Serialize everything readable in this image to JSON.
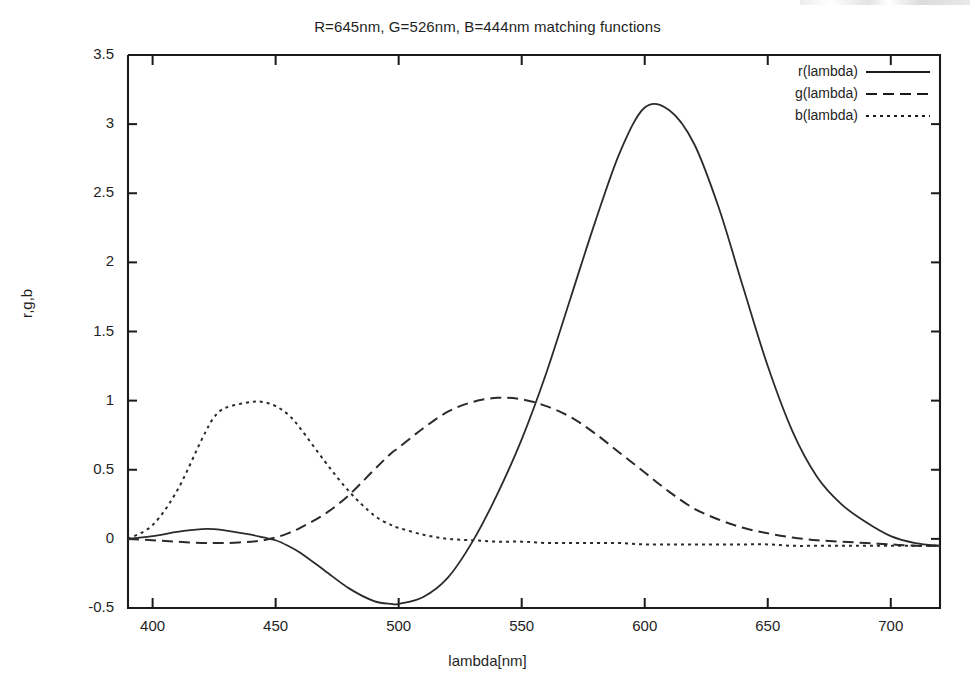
{
  "chart_data": {
    "type": "line",
    "title": "R=645nm, G=526nm, B=444nm matching functions",
    "xlabel": "lambda[nm]",
    "ylabel": "r,g,b",
    "xlim": [
      390,
      720
    ],
    "ylim": [
      -0.5,
      3.5
    ],
    "grid": false,
    "legend_position": "top-right inside",
    "xticks": [
      400,
      450,
      500,
      550,
      600,
      650,
      700
    ],
    "xtick_labels": [
      "400",
      "450",
      "500",
      "550",
      "600",
      "650",
      "700"
    ],
    "yticks": [
      -0.5,
      0,
      0.5,
      1,
      1.5,
      2,
      2.5,
      3,
      3.5
    ],
    "ytick_labels": [
      "-0.5",
      "0",
      "0.5",
      "1",
      "1.5",
      "2",
      "2.5",
      "3",
      "3.5"
    ],
    "x": [
      390,
      400,
      410,
      420,
      425,
      430,
      440,
      445,
      450,
      455,
      460,
      470,
      480,
      490,
      497,
      500,
      510,
      520,
      530,
      540,
      550,
      560,
      570,
      580,
      590,
      600,
      610,
      620,
      630,
      640,
      650,
      660,
      670,
      680,
      690,
      700,
      710,
      720
    ],
    "series": [
      {
        "name": "r(lambda)",
        "style": "solid",
        "values": [
          0.0,
          0.02,
          0.05,
          0.07,
          0.07,
          0.06,
          0.03,
          0.01,
          -0.01,
          -0.05,
          -0.1,
          -0.23,
          -0.36,
          -0.45,
          -0.47,
          -0.47,
          -0.42,
          -0.28,
          -0.02,
          0.32,
          0.72,
          1.2,
          1.75,
          2.3,
          2.8,
          3.12,
          3.1,
          2.86,
          2.4,
          1.82,
          1.25,
          0.78,
          0.45,
          0.25,
          0.12,
          0.02,
          -0.03,
          -0.05
        ]
      },
      {
        "name": "g(lambda)",
        "style": "dashed",
        "values": [
          0.0,
          -0.01,
          -0.02,
          -0.03,
          -0.03,
          -0.03,
          -0.02,
          -0.01,
          0.01,
          0.04,
          0.08,
          0.18,
          0.32,
          0.5,
          0.62,
          0.66,
          0.8,
          0.92,
          0.99,
          1.02,
          1.01,
          0.96,
          0.88,
          0.76,
          0.62,
          0.48,
          0.34,
          0.22,
          0.14,
          0.08,
          0.04,
          0.01,
          -0.01,
          -0.02,
          -0.03,
          -0.04,
          -0.05,
          -0.05
        ]
      },
      {
        "name": "b(lambda)",
        "style": "dotted",
        "values": [
          0.0,
          0.1,
          0.35,
          0.72,
          0.88,
          0.95,
          0.99,
          0.99,
          0.96,
          0.9,
          0.8,
          0.56,
          0.34,
          0.17,
          0.1,
          0.08,
          0.03,
          0.0,
          -0.01,
          -0.02,
          -0.02,
          -0.03,
          -0.03,
          -0.03,
          -0.03,
          -0.04,
          -0.04,
          -0.04,
          -0.04,
          -0.04,
          -0.04,
          -0.05,
          -0.05,
          -0.05,
          -0.05,
          -0.05,
          -0.05,
          -0.05
        ]
      }
    ],
    "annotations": {
      "r_peak": {
        "x": 600,
        "y": 3.12
      },
      "r_min": {
        "x": 497,
        "y": -0.47
      },
      "g_peak": {
        "x": 542,
        "y": 1.02
      },
      "b_peak": {
        "x": 445,
        "y": 0.99
      }
    },
    "colors": {
      "axis": "#1a1a1a",
      "r_line": "#2b2b2b",
      "g_line": "#2b2b2b",
      "b_line": "#2b2b2b",
      "background": "#ffffff"
    }
  },
  "legend": {
    "entries": [
      {
        "label": "r(lambda)"
      },
      {
        "label": "g(lambda)"
      },
      {
        "label": "b(lambda)"
      }
    ]
  }
}
